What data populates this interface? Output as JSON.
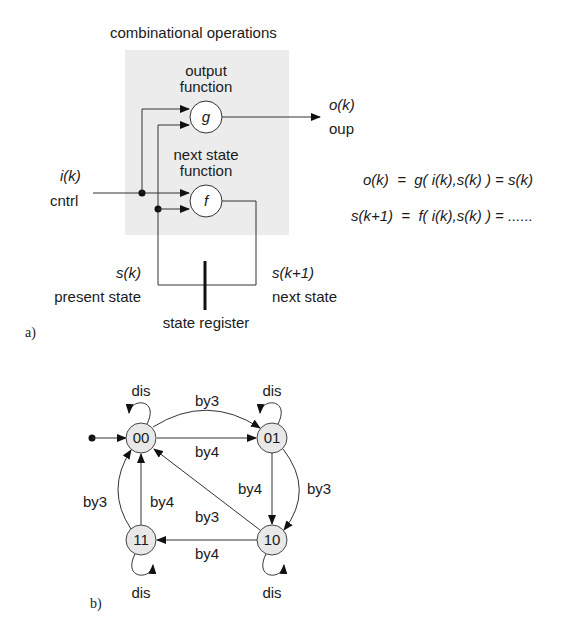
{
  "part_a": {
    "label": "a)",
    "box_title": "combinational operations",
    "box_fill": "#ececec",
    "output_function": {
      "label_line1": "output",
      "label_line2": "function",
      "symbol": "g"
    },
    "next_state_function": {
      "label_line1": "next state",
      "label_line2": "function",
      "symbol": "f"
    },
    "input": {
      "signal": "i(k)",
      "name": "cntrl"
    },
    "output": {
      "signal": "o(k)",
      "name": "oup"
    },
    "present_state": {
      "signal": "s(k)",
      "name": "present state"
    },
    "next_state": {
      "signal": "s(k+1)",
      "name": "next state"
    },
    "register_label": "state register",
    "equations": {
      "eq1": "o(k)  =  g( i(k),s(k) ) = s(k)",
      "eq2": "s(k+1)  =  f( i(k),s(k) ) = ......"
    }
  },
  "part_b": {
    "label": "b)",
    "node_fill": "#e8e8e8",
    "states": [
      {
        "id": "00",
        "label": "00",
        "initial": true
      },
      {
        "id": "01",
        "label": "01"
      },
      {
        "id": "10",
        "label": "10"
      },
      {
        "id": "11",
        "label": "11"
      }
    ],
    "transitions": [
      {
        "from": "00",
        "to": "00",
        "label": "dis"
      },
      {
        "from": "01",
        "to": "01",
        "label": "dis"
      },
      {
        "from": "10",
        "to": "10",
        "label": "dis"
      },
      {
        "from": "11",
        "to": "11",
        "label": "dis"
      },
      {
        "from": "00",
        "to": "01",
        "label": "by3"
      },
      {
        "from": "00",
        "to": "01",
        "label": "by4"
      },
      {
        "from": "01",
        "to": "10",
        "label": "by4"
      },
      {
        "from": "01",
        "to": "10",
        "label": "by3"
      },
      {
        "from": "10",
        "to": "11",
        "label": "by4"
      },
      {
        "from": "10",
        "to": "00",
        "label": "by3"
      },
      {
        "from": "11",
        "to": "00",
        "label": "by4"
      },
      {
        "from": "11",
        "to": "00",
        "label": "by3"
      }
    ]
  }
}
